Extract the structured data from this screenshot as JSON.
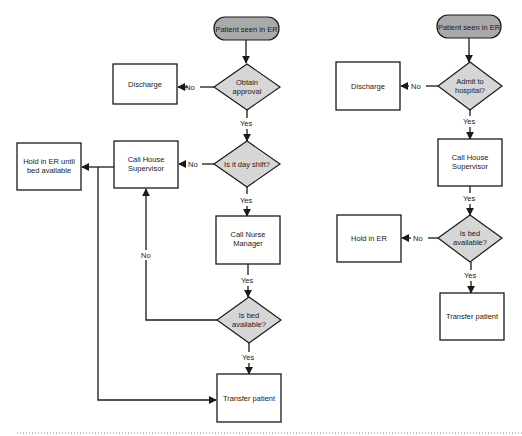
{
  "diagram": {
    "colors": {
      "terminal_fill": "#a9a9a9",
      "decision_fill": "#d6d6d6",
      "process_fill": "#ffffff",
      "stroke": "#1a1a1a"
    },
    "left_flow": {
      "nodes": [
        {
          "id": "L_start",
          "type": "terminal",
          "lines": [
            "Patient seen in ER"
          ],
          "x": 214,
          "y": 17,
          "w": 65,
          "h": 23
        },
        {
          "id": "L_approval",
          "type": "decision",
          "lines": [
            "Obtain",
            "approval"
          ],
          "cx": 247,
          "cy": 87,
          "w": 66,
          "h": 46
        },
        {
          "id": "L_discharge",
          "type": "process",
          "lines": [
            "Discharge"
          ],
          "x": 113,
          "y": 64,
          "w": 64,
          "h": 40
        },
        {
          "id": "L_dayshift",
          "type": "decision",
          "lines": [
            "Is it day shift?"
          ],
          "cx": 247,
          "cy": 164,
          "w": 66,
          "h": 46
        },
        {
          "id": "L_house_sup",
          "type": "process",
          "lines": [
            "Call House",
            "Supervisor"
          ],
          "x": 114,
          "y": 141,
          "w": 64,
          "h": 47
        },
        {
          "id": "L_hold",
          "type": "process",
          "lines": [
            "Hold in ER until",
            "bed available"
          ],
          "x": 17,
          "y": 143,
          "w": 64,
          "h": 47
        },
        {
          "id": "L_nurse_mgr",
          "type": "process",
          "lines": [
            "Call Nurse",
            "Manager"
          ],
          "x": 216,
          "y": 216,
          "w": 64,
          "h": 48
        },
        {
          "id": "L_bed",
          "type": "decision",
          "lines": [
            "Is bed",
            "available?"
          ],
          "cx": 249,
          "cy": 320,
          "w": 64,
          "h": 46
        },
        {
          "id": "L_transfer",
          "type": "process",
          "lines": [
            "Transfer patient"
          ],
          "x": 217,
          "y": 374,
          "w": 64,
          "h": 48
        }
      ],
      "edges": [
        {
          "from": "L_start",
          "to": "L_approval",
          "label": ""
        },
        {
          "from": "L_approval",
          "to": "L_discharge",
          "label": "No"
        },
        {
          "from": "L_approval",
          "to": "L_dayshift",
          "label": "Yes"
        },
        {
          "from": "L_dayshift",
          "to": "L_house_sup",
          "label": "No"
        },
        {
          "from": "L_dayshift",
          "to": "L_nurse_mgr",
          "label": "Yes"
        },
        {
          "from": "L_house_sup",
          "to": "L_hold",
          "label": ""
        },
        {
          "from": "L_house_sup",
          "to": "L_transfer",
          "label": ""
        },
        {
          "from": "L_nurse_mgr",
          "to": "L_bed",
          "label": "Yes"
        },
        {
          "from": "L_bed",
          "to": "L_house_sup",
          "label": "No"
        },
        {
          "from": "L_bed",
          "to": "L_transfer",
          "label": "Yes"
        }
      ]
    },
    "right_flow": {
      "nodes": [
        {
          "id": "R_start",
          "type": "terminal",
          "lines": [
            "Patient seen in ER"
          ],
          "x": 437,
          "y": 15,
          "w": 64,
          "h": 23
        },
        {
          "id": "R_admit",
          "type": "decision",
          "lines": [
            "Admit to",
            "hospital?"
          ],
          "cx": 470,
          "cy": 86,
          "w": 64,
          "h": 48
        },
        {
          "id": "R_discharge",
          "type": "process",
          "lines": [
            "Discharge"
          ],
          "x": 336,
          "y": 62,
          "w": 64,
          "h": 48
        },
        {
          "id": "R_house_sup",
          "type": "process",
          "lines": [
            "Call House",
            "Supervisor"
          ],
          "x": 438,
          "y": 139,
          "w": 64,
          "h": 47
        },
        {
          "id": "R_bed",
          "type": "decision",
          "lines": [
            "Is bed",
            "available?"
          ],
          "cx": 470,
          "cy": 238,
          "w": 64,
          "h": 47
        },
        {
          "id": "R_hold",
          "type": "process",
          "lines": [
            "Hold in ER"
          ],
          "x": 337,
          "y": 215,
          "w": 64,
          "h": 47
        },
        {
          "id": "R_transfer",
          "type": "process",
          "lines": [
            "Transfer patient"
          ],
          "x": 440,
          "y": 293,
          "w": 64,
          "h": 47
        }
      ],
      "edges": [
        {
          "from": "R_start",
          "to": "R_admit",
          "label": ""
        },
        {
          "from": "R_admit",
          "to": "R_discharge",
          "label": "No"
        },
        {
          "from": "R_admit",
          "to": "R_house_sup",
          "label": "Yes"
        },
        {
          "from": "R_house_sup",
          "to": "R_bed",
          "label": "Yes"
        },
        {
          "from": "R_bed",
          "to": "R_hold",
          "label": "No"
        },
        {
          "from": "R_bed",
          "to": "R_transfer",
          "label": "Yes"
        }
      ]
    },
    "labels": {
      "yes": "Yes",
      "no": "No"
    }
  }
}
